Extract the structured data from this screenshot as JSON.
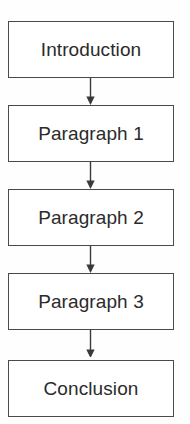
{
  "diagram": {
    "type": "flowchart",
    "orientation": "vertical",
    "colors": {
      "background": "#fefefe",
      "box_fill": "#ffffff",
      "box_border": "#4a4a4a",
      "text": "#2b2b2b",
      "arrow": "#3a3a3a"
    },
    "nodes": [
      {
        "id": "introduction",
        "label": "Introduction"
      },
      {
        "id": "paragraph-1",
        "label": "Paragraph 1"
      },
      {
        "id": "paragraph-2",
        "label": "Paragraph 2"
      },
      {
        "id": "paragraph-3",
        "label": "Paragraph 3"
      },
      {
        "id": "conclusion",
        "label": "Conclusion"
      }
    ],
    "connectors": [
      {
        "id": "introduction-to-paragraph-1",
        "from": "introduction",
        "to": "paragraph-1",
        "style": "arrow-down"
      },
      {
        "id": "paragraph-1-to-paragraph-2",
        "from": "paragraph-1",
        "to": "paragraph-2",
        "style": "arrow-down"
      },
      {
        "id": "paragraph-2-to-paragraph-3",
        "from": "paragraph-2",
        "to": "paragraph-3",
        "style": "arrow-down"
      },
      {
        "id": "paragraph-3-to-conclusion",
        "from": "paragraph-3",
        "to": "conclusion",
        "style": "arrow-down"
      }
    ]
  }
}
